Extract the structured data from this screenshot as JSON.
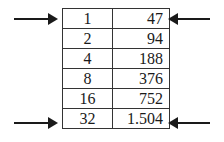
{
  "table": {
    "rows": [
      {
        "n": "1",
        "value": "47"
      },
      {
        "n": "2",
        "value": "94"
      },
      {
        "n": "4",
        "value": "188"
      },
      {
        "n": "8",
        "value": "376"
      },
      {
        "n": "16",
        "value": "752"
      },
      {
        "n": "32",
        "value": "1.504"
      }
    ]
  },
  "arrows": [
    {
      "row": 0,
      "side": "left",
      "direction": "right-pointing"
    },
    {
      "row": 0,
      "side": "right",
      "direction": "left-pointing"
    },
    {
      "row": 5,
      "side": "left",
      "direction": "right-pointing"
    },
    {
      "row": 5,
      "side": "right",
      "direction": "left-pointing"
    }
  ]
}
